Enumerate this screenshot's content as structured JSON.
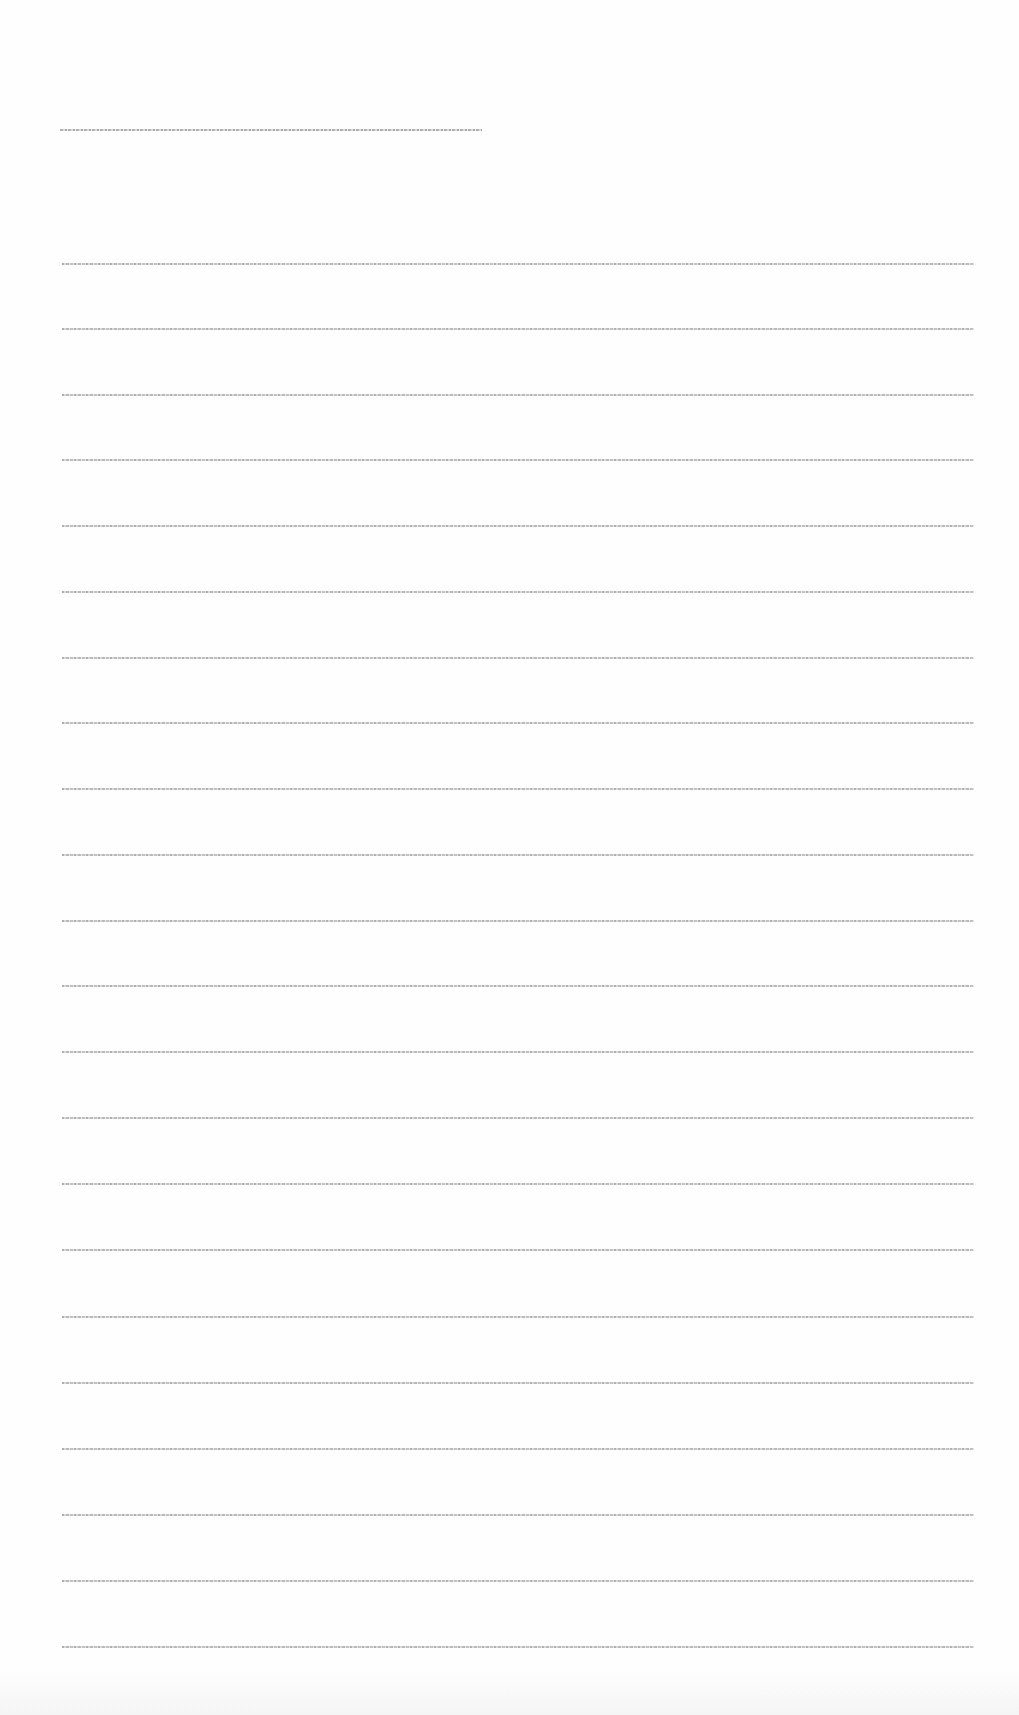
{
  "document": {
    "title": "[illegible title text]",
    "lines": [
      {
        "top": 263,
        "text": "[illegible text line 1]"
      },
      {
        "top": 328,
        "text": "[illegible text line 2]"
      },
      {
        "top": 394,
        "text": "[illegible text line 3]"
      },
      {
        "top": 459,
        "text": "[illegible text line 4]"
      },
      {
        "top": 525,
        "text": "[illegible text line 5]"
      },
      {
        "top": 591,
        "text": "[illegible text line 6]"
      },
      {
        "top": 657,
        "text": "[illegible text line 7]"
      },
      {
        "top": 722,
        "text": "[illegible text line 8]"
      },
      {
        "top": 788,
        "text": "[illegible text line 9]"
      },
      {
        "top": 854,
        "text": "[illegible text line 10]"
      },
      {
        "top": 920,
        "text": "[illegible text line 11]"
      },
      {
        "top": 985,
        "text": "[illegible text line 12]"
      },
      {
        "top": 1051,
        "text": "[illegible text line 13]"
      },
      {
        "top": 1117,
        "text": "[illegible text line 14]"
      },
      {
        "top": 1183,
        "text": "[illegible text line 15]"
      },
      {
        "top": 1249,
        "text": "[illegible text line 16]"
      },
      {
        "top": 1316,
        "text": "[illegible text line 17]"
      },
      {
        "top": 1382,
        "text": "[illegible text line 18]"
      },
      {
        "top": 1448,
        "text": "[illegible text line 19]"
      },
      {
        "top": 1514,
        "text": "[illegible text line 20]"
      },
      {
        "top": 1580,
        "text": "[illegible text line 21]"
      },
      {
        "top": 1646,
        "text": "[illegible text line 22]"
      }
    ]
  }
}
